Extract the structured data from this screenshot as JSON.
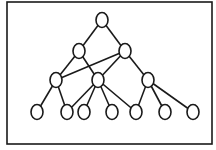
{
  "diagram": {
    "type": "tree-graph",
    "stroke_color": "#1a1a1a",
    "fill_color": "#ffffff",
    "frame": {
      "x": 7,
      "y": 2,
      "width": 205,
      "height": 142
    },
    "node_rx": 6,
    "node_ry": 7.5,
    "nodes": [
      {
        "id": "root",
        "level": 0,
        "x": 102,
        "y": 20
      },
      {
        "id": "l1-a",
        "level": 1,
        "x": 79,
        "y": 51
      },
      {
        "id": "l1-b",
        "level": 1,
        "x": 125,
        "y": 51
      },
      {
        "id": "l2-a",
        "level": 2,
        "x": 56,
        "y": 80
      },
      {
        "id": "l2-b",
        "level": 2,
        "x": 98,
        "y": 80
      },
      {
        "id": "l2-c",
        "level": 2,
        "x": 148,
        "y": 80
      },
      {
        "id": "leaf-1",
        "level": 3,
        "x": 37,
        "y": 112
      },
      {
        "id": "leaf-2",
        "level": 3,
        "x": 67,
        "y": 112
      },
      {
        "id": "leaf-3",
        "level": 3,
        "x": 84,
        "y": 112
      },
      {
        "id": "leaf-4",
        "level": 3,
        "x": 112,
        "y": 112
      },
      {
        "id": "leaf-5",
        "level": 3,
        "x": 136,
        "y": 112
      },
      {
        "id": "leaf-6",
        "level": 3,
        "x": 165,
        "y": 112
      },
      {
        "id": "leaf-7",
        "level": 3,
        "x": 193,
        "y": 112
      }
    ],
    "edges": [
      [
        "root",
        "l1-a"
      ],
      [
        "root",
        "l1-b"
      ],
      [
        "l1-a",
        "l2-a"
      ],
      [
        "l1-a",
        "l2-b"
      ],
      [
        "l1-b",
        "l2-a"
      ],
      [
        "l1-b",
        "l2-b"
      ],
      [
        "l1-b",
        "l2-c"
      ],
      [
        "l2-a",
        "leaf-1"
      ],
      [
        "l2-a",
        "leaf-2"
      ],
      [
        "l2-b",
        "leaf-2"
      ],
      [
        "l2-b",
        "leaf-3"
      ],
      [
        "l2-b",
        "leaf-4"
      ],
      [
        "l2-b",
        "leaf-5"
      ],
      [
        "l2-c",
        "leaf-5"
      ],
      [
        "l2-c",
        "leaf-6"
      ],
      [
        "l2-c",
        "leaf-7"
      ]
    ]
  }
}
